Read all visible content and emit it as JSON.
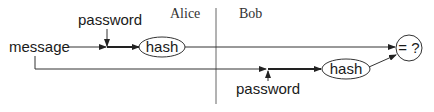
{
  "diagram": {
    "parties": {
      "left": "Alice",
      "right": "Bob"
    },
    "inputs": {
      "message": "message",
      "password_top": "password",
      "password_bottom": "password"
    },
    "nodes": {
      "alice_hash": "hash",
      "bob_hash": "hash",
      "compare": "= ?"
    },
    "colors": {
      "stroke": "#333333",
      "divider": "#555555",
      "text": "#1a1a1a"
    }
  }
}
